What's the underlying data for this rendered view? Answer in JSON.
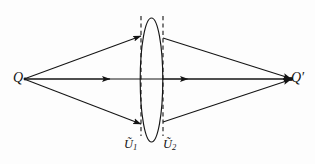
{
  "figure": {
    "kind": "optics-ray-diagram",
    "background_color": "#fdfdfd",
    "stroke_color": "#141414",
    "labels": {
      "source": "Q",
      "image": "Q′",
      "surface_1_base": "Ũ",
      "surface_1_sub": "1",
      "surface_2_base": "Ũ",
      "surface_2_sub": "2",
      "surface_1_full": "Ũ1",
      "surface_2_full": "Ũ2"
    },
    "geometry": {
      "source_point": [
        24,
        79
      ],
      "image_point": [
        293,
        79
      ],
      "lens_center": [
        151,
        80
      ],
      "lens_rx": 11,
      "lens_ry": 62,
      "dashed_line_1_x": 141,
      "dashed_line_2_x": 163,
      "dashed_line_top_y": 16,
      "dashed_line_bottom_y": 136,
      "upper_hit_y": 36,
      "lower_hit_y": 124,
      "axis_arrow_1_x": 105,
      "axis_arrow_2_x": 182
    },
    "rays": [
      {
        "name": "upper-incident",
        "from": [
          24,
          79
        ],
        "to": [
          141,
          36
        ]
      },
      {
        "name": "axis-incident",
        "from": [
          24,
          79
        ],
        "to": [
          141,
          79
        ]
      },
      {
        "name": "lower-incident",
        "from": [
          24,
          79
        ],
        "to": [
          141,
          124
        ]
      },
      {
        "name": "upper-emergent",
        "from": [
          163,
          38
        ],
        "to": [
          293,
          79
        ]
      },
      {
        "name": "axis-emergent",
        "from": [
          163,
          79
        ],
        "to": [
          293,
          79
        ]
      },
      {
        "name": "lower-emergent",
        "from": [
          163,
          122
        ],
        "to": [
          293,
          79
        ]
      }
    ]
  }
}
